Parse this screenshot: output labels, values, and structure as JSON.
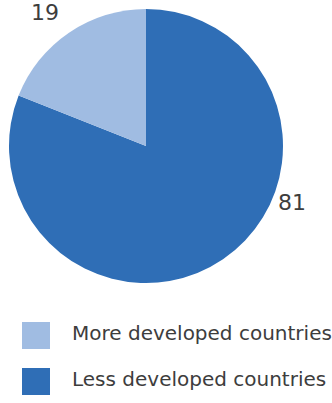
{
  "chart_data": {
    "type": "pie",
    "title": "",
    "subtitle": "",
    "xlabel": "",
    "ylabel": "",
    "grid": false,
    "legend_position": "bottom-left",
    "units": "percent",
    "start_angle_deg": 0,
    "direction": "counterclockwise",
    "categories": [
      "More developed countries",
      "Less developed countries"
    ],
    "values": [
      19,
      81
    ],
    "colors": [
      "#A0BCE2",
      "#2F6EB6"
    ],
    "slices": [
      {
        "label": "More developed countries",
        "value": 19,
        "value_text": "19",
        "color": "#A0BCE2",
        "start_deg": 0,
        "sweep_deg": 68.4
      },
      {
        "label": "Less developed countries",
        "value": 81,
        "value_text": "81",
        "color": "#2F6EB6",
        "start_deg": 68.4,
        "sweep_deg": 291.6
      }
    ],
    "data_labels": [
      "19",
      "81"
    ]
  },
  "pie": {
    "label_more": "19",
    "label_less": "81",
    "slice_more_color": "#A0BCE2",
    "slice_less_color": "#2F6EB6"
  },
  "legend": {
    "items": [
      {
        "label": "More developed countries",
        "color": "#A0BCE2"
      },
      {
        "label": "Less developed countries",
        "color": "#2F6EB6"
      }
    ]
  },
  "theme": {
    "background": "#FFFFFF",
    "text_color": "#3D3D3D",
    "light_blue": "#A0BCE2",
    "dark_blue": "#2F6EB6"
  }
}
